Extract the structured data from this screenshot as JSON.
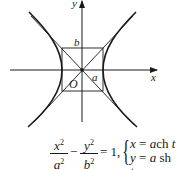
{
  "diagram": {
    "type": "hyperbola-with-asymptotes",
    "axes": {
      "x_label": "x",
      "y_label": "y"
    },
    "origin_label": "O",
    "semi_axis_labels": {
      "a": "a",
      "b": "b"
    },
    "stroke_color": "#1a1a1a"
  },
  "formula": {
    "frac1": {
      "num": "x",
      "num_exp": "2",
      "den": "a",
      "den_exp": "2"
    },
    "minus": "−",
    "frac2": {
      "num": "y",
      "num_exp": "2",
      "den": "b",
      "den_exp": "2"
    },
    "equals_one": "= 1,",
    "param": {
      "line1_lhs": "x",
      "line1_eq": " = ",
      "line1_rhs_var": "a",
      "line1_rhs_fn": "ch",
      "line1_rhs_t": " t",
      "line2_lhs": "y",
      "line2_eq": " = ",
      "line2_rhs_var": "a",
      "line2_rhs_fn": " sh",
      "line2_rhs_t": " t"
    }
  }
}
